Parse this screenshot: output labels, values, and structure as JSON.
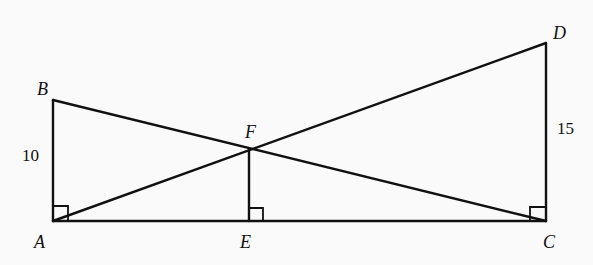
{
  "diagram": {
    "points": {
      "A": {
        "label": "A",
        "x": 53,
        "y": 221
      },
      "B": {
        "label": "B",
        "x": 53,
        "y": 100
      },
      "C": {
        "label": "C",
        "x": 546,
        "y": 221
      },
      "D": {
        "label": "D",
        "x": 546,
        "y": 43
      },
      "E": {
        "label": "E",
        "x": 249,
        "y": 221
      },
      "F": {
        "label": "F",
        "x": 249,
        "y": 149
      }
    },
    "segments": [
      {
        "from": "A",
        "to": "B"
      },
      {
        "from": "A",
        "to": "C"
      },
      {
        "from": "C",
        "to": "D"
      },
      {
        "from": "B",
        "to": "C"
      },
      {
        "from": "A",
        "to": "D"
      },
      {
        "from": "F",
        "to": "E"
      }
    ],
    "measures": {
      "AB": "10",
      "CD": "15"
    },
    "right_angles": [
      "A",
      "E",
      "C"
    ],
    "stroke_color": "#111111",
    "background": "#fafafa"
  }
}
